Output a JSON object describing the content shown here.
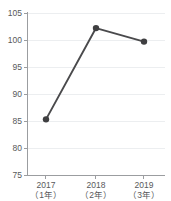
{
  "chart_data": {
    "type": "line",
    "title": "",
    "subtitle": "",
    "xlabel": "",
    "ylabel": "",
    "categories": [
      "2017\n（1年）",
      "2018\n（2年）",
      "2019\n（3年）"
    ],
    "category_lines": [
      [
        "2017",
        "（1年）"
      ],
      [
        "2018",
        "（2年）"
      ],
      [
        "2019",
        "（3年）"
      ]
    ],
    "values": [
      85.4,
      102.3,
      99.8
    ],
    "series": [
      {
        "name": "series-1",
        "values": [
          85.4,
          102.3,
          99.8
        ]
      }
    ],
    "ylim": [
      75,
      105
    ],
    "yticks": [
      75,
      80,
      85,
      90,
      95,
      100,
      105
    ],
    "ytick_labels": [
      "75",
      "80",
      "85",
      "90",
      "95",
      "100",
      "105"
    ],
    "xtick_labels": [
      "2017",
      "2018",
      "2019"
    ],
    "grid": true,
    "grid_axis": "y",
    "legend": false,
    "legend_position": "none",
    "marker": "circle",
    "colors": {
      "line": "#4a4a4c",
      "marker": "#3f3f41",
      "grid": "#eceef0",
      "axis": "#9b9da0",
      "text": "#58595b",
      "background": "#ffffff"
    }
  }
}
